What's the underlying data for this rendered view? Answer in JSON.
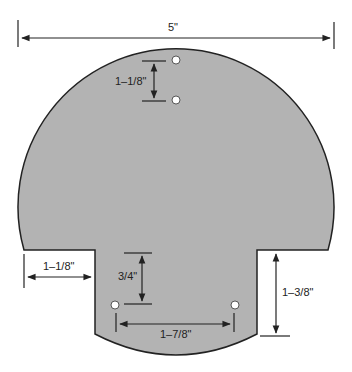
{
  "diagram": {
    "shape_fill": "#b3b3b3",
    "outline_color": "#222222",
    "dimensions": {
      "overall_width": "5\"",
      "top_hole_spacing": "1–1/8\"",
      "left_shoulder_width": "1–1/8\"",
      "stem_hole_offset": "3/4\"",
      "stem_hole_spacing": "1–7/8\"",
      "stem_height": "1–3/8\""
    }
  }
}
